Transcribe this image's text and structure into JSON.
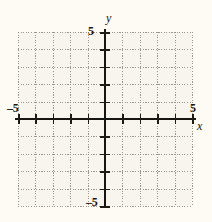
{
  "figure": {
    "type": "coordinate-grid",
    "background_color": "#fdfbf4",
    "plot_background_color": "#f7f5ee",
    "grid_color": "#8a867c",
    "axis_color": "#17150f"
  },
  "axes": {
    "x": {
      "name": "x",
      "min_label": "–5",
      "max_label": "5",
      "min": -5,
      "max": 5,
      "tick_step": 1
    },
    "y": {
      "name": "y",
      "min_label": "–5",
      "max_label": "5",
      "min": -5,
      "max": 5,
      "tick_step": 1
    }
  },
  "chart_data": {
    "type": "scatter",
    "title": "",
    "xlabel": "x",
    "ylabel": "y",
    "xlim": [
      -5,
      5
    ],
    "ylim": [
      -5,
      5
    ],
    "xticks": [
      -5,
      -4,
      -3,
      -2,
      -1,
      0,
      1,
      2,
      3,
      4,
      5
    ],
    "yticks": [
      -5,
      -4,
      -3,
      -2,
      -1,
      0,
      1,
      2,
      3,
      4,
      5
    ],
    "xtick_labels": [
      "–5",
      "",
      "",
      "",
      "",
      "",
      "",
      "",
      "",
      "",
      "5"
    ],
    "ytick_labels": [
      "–5",
      "",
      "",
      "",
      "",
      "",
      "",
      "",
      "",
      "",
      "5"
    ],
    "grid": true,
    "grid_style": "dotted",
    "legend": null,
    "series": [],
    "annotations": []
  }
}
